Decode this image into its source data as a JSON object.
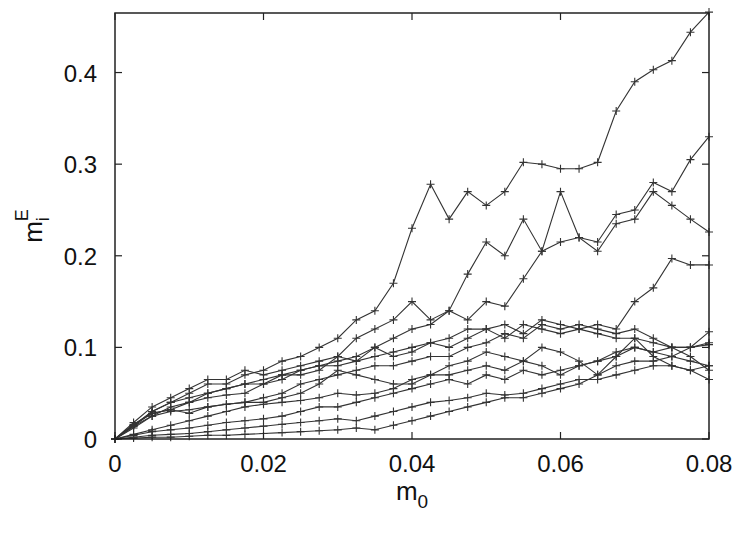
{
  "chart_data": {
    "type": "line",
    "title": "",
    "xlabel": "m_0",
    "ylabel": "m_i^E",
    "xlim": [
      0,
      0.08
    ],
    "ylim": [
      0,
      0.465
    ],
    "xticks": [
      0,
      0.02,
      0.04,
      0.06,
      0.08
    ],
    "xtick_labels": [
      "0",
      "0.02",
      "0.04",
      "0.06",
      "0.08"
    ],
    "yticks": [
      0,
      0.1,
      0.2,
      0.3,
      0.4
    ],
    "ytick_labels": [
      "0",
      "0.1",
      "0.2",
      "0.3",
      "0.4"
    ],
    "grid": false,
    "legend": "none",
    "marker": "+",
    "line_color": "#333333",
    "x": [
      0,
      0.0025,
      0.005,
      0.0075,
      0.01,
      0.0125,
      0.015,
      0.0175,
      0.02,
      0.0225,
      0.025,
      0.0275,
      0.03,
      0.0325,
      0.035,
      0.0375,
      0.04,
      0.0425,
      0.045,
      0.0475,
      0.05,
      0.0525,
      0.055,
      0.0575,
      0.06,
      0.0625,
      0.065,
      0.0675,
      0.07,
      0.0725,
      0.075,
      0.0775,
      0.08
    ],
    "series": [
      {
        "name": "s1",
        "values": [
          0,
          0.015,
          0.03,
          0.04,
          0.05,
          0.06,
          0.06,
          0.07,
          0.075,
          0.085,
          0.09,
          0.1,
          0.11,
          0.13,
          0.14,
          0.17,
          0.23,
          0.278,
          0.24,
          0.27,
          0.255,
          0.27,
          0.302,
          0.3,
          0.295,
          0.295,
          0.302,
          0.358,
          0.39,
          0.403,
          0.413,
          0.444,
          0.466
        ]
      },
      {
        "name": "s2",
        "values": [
          0,
          0.018,
          0.035,
          0.045,
          0.055,
          0.065,
          0.065,
          0.075,
          0.07,
          0.075,
          0.08,
          0.085,
          0.09,
          0.11,
          0.12,
          0.13,
          0.15,
          0.13,
          0.14,
          0.18,
          0.215,
          0.2,
          0.24,
          0.205,
          0.27,
          0.22,
          0.215,
          0.245,
          0.25,
          0.28,
          0.27,
          0.305,
          0.33
        ]
      },
      {
        "name": "s3",
        "values": [
          0,
          0.012,
          0.025,
          0.035,
          0.04,
          0.05,
          0.055,
          0.06,
          0.065,
          0.07,
          0.075,
          0.08,
          0.085,
          0.09,
          0.1,
          0.11,
          0.12,
          0.125,
          0.14,
          0.13,
          0.15,
          0.145,
          0.175,
          0.205,
          0.215,
          0.22,
          0.205,
          0.235,
          0.24,
          0.27,
          0.255,
          0.24,
          0.226
        ]
      },
      {
        "name": "s4",
        "values": [
          0,
          0.015,
          0.028,
          0.032,
          0.04,
          0.045,
          0.048,
          0.05,
          0.06,
          0.07,
          0.07,
          0.075,
          0.09,
          0.085,
          0.1,
          0.09,
          0.095,
          0.105,
          0.1,
          0.11,
          0.12,
          0.11,
          0.125,
          0.12,
          0.115,
          0.12,
          0.125,
          0.12,
          0.15,
          0.165,
          0.197,
          0.19,
          0.19
        ]
      },
      {
        "name": "s5",
        "values": [
          0,
          0.014,
          0.03,
          0.04,
          0.045,
          0.05,
          0.055,
          0.06,
          0.06,
          0.065,
          0.075,
          0.08,
          0.08,
          0.085,
          0.09,
          0.095,
          0.1,
          0.105,
          0.11,
          0.12,
          0.12,
          0.125,
          0.115,
          0.13,
          0.125,
          0.12,
          0.115,
          0.11,
          0.11,
          0.105,
          0.1,
          0.1,
          0.117
        ]
      },
      {
        "name": "s6",
        "values": [
          0,
          0.016,
          0.028,
          0.032,
          0.028,
          0.035,
          0.038,
          0.04,
          0.045,
          0.05,
          0.06,
          0.065,
          0.07,
          0.075,
          0.08,
          0.08,
          0.085,
          0.09,
          0.09,
          0.1,
          0.105,
          0.115,
          0.11,
          0.125,
          0.12,
          0.125,
          0.12,
          0.115,
          0.12,
          0.11,
          0.1,
          0.09,
          0.075
        ]
      },
      {
        "name": "s7",
        "values": [
          0,
          0.014,
          0.025,
          0.03,
          0.032,
          0.035,
          0.038,
          0.04,
          0.04,
          0.045,
          0.05,
          0.06,
          0.075,
          0.07,
          0.065,
          0.06,
          0.06,
          0.07,
          0.08,
          0.085,
          0.095,
          0.09,
          0.085,
          0.1,
          0.095,
          0.085,
          0.07,
          0.09,
          0.11,
          0.09,
          0.08,
          0.075,
          0.065
        ]
      },
      {
        "name": "s8",
        "values": [
          0,
          0.005,
          0.01,
          0.015,
          0.02,
          0.025,
          0.03,
          0.035,
          0.038,
          0.04,
          0.042,
          0.045,
          0.05,
          0.048,
          0.05,
          0.055,
          0.065,
          0.07,
          0.07,
          0.075,
          0.08,
          0.075,
          0.085,
          0.08,
          0.07,
          0.08,
          0.085,
          0.095,
          0.1,
          0.095,
          0.1,
          0.1,
          0.103
        ]
      },
      {
        "name": "s9",
        "values": [
          0,
          0.004,
          0.008,
          0.01,
          0.012,
          0.015,
          0.018,
          0.02,
          0.022,
          0.025,
          0.03,
          0.035,
          0.035,
          0.04,
          0.045,
          0.05,
          0.055,
          0.06,
          0.065,
          0.06,
          0.07,
          0.065,
          0.075,
          0.07,
          0.075,
          0.08,
          0.085,
          0.09,
          0.1,
          0.095,
          0.09,
          0.1,
          0.105
        ]
      },
      {
        "name": "s10",
        "values": [
          0,
          0.002,
          0.004,
          0.005,
          0.006,
          0.008,
          0.01,
          0.012,
          0.014,
          0.016,
          0.018,
          0.02,
          0.022,
          0.02,
          0.025,
          0.03,
          0.035,
          0.04,
          0.042,
          0.045,
          0.05,
          0.048,
          0.05,
          0.055,
          0.06,
          0.065,
          0.065,
          0.07,
          0.075,
          0.08,
          0.08,
          0.075,
          0.08
        ]
      },
      {
        "name": "s11",
        "values": [
          0,
          0.001,
          0.002,
          0.002,
          0.003,
          0.004,
          0.004,
          0.005,
          0.006,
          0.007,
          0.008,
          0.009,
          0.01,
          0.012,
          0.01,
          0.015,
          0.02,
          0.025,
          0.03,
          0.035,
          0.04,
          0.045,
          0.045,
          0.05,
          0.055,
          0.06,
          0.07,
          0.08,
          0.085,
          0.085,
          0.09,
          0.085,
          0.08
        ]
      }
    ]
  }
}
